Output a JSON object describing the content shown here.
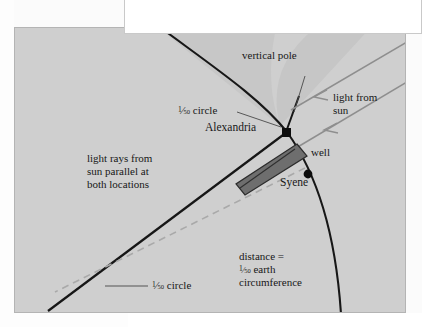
{
  "figure": {
    "background_color": "#cfcfcf",
    "border_color": "#b4b4b4",
    "wedge_color": "#c4c4c4",
    "line_color": "#111111",
    "ray_color": "#8e8e8e",
    "dash_color": "#a9a9a9",
    "well_color": "#4a4a4a",
    "labels": {
      "vertical_pole": "vertical pole",
      "fifty_circle_top": "circle",
      "fifty_circle_bottom": "circle",
      "alexandria": "Alexandria",
      "light_from_sun_line1": "light from",
      "light_from_sun_line2": "sun",
      "well": "well",
      "syene": "Syene",
      "light_rays_line1": "light rays from",
      "light_rays_line2": "sun parallel at",
      "light_rays_line3": "both locations",
      "distance_line1": "distance =",
      "distance_line2": "earth",
      "distance_line3": "circumference",
      "fraction_numerator": "1",
      "fraction_denominator": "50"
    },
    "icons": {
      "alexandria_marker": "filled-dot-icon",
      "syene_marker": "filled-dot-icon",
      "sun_ray_arrow": "arrowhead-icon"
    }
  }
}
